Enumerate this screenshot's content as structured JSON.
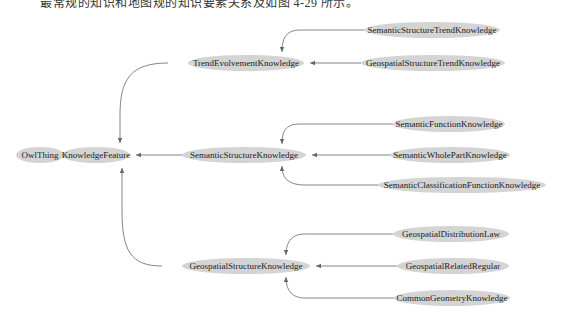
{
  "caption": "最常规的知识和地图规的知识要素关系及如图 4-29 所示。",
  "diagram": {
    "type": "ontology-class-hierarchy",
    "nodes": [
      {
        "id": "owlthing",
        "label": "OwlThing",
        "cx": 40,
        "cy": 155,
        "rx": 24
      },
      {
        "id": "knowledgefeature",
        "label": "KnowledgeFeature",
        "cx": 96,
        "cy": 155,
        "rx": 34
      },
      {
        "id": "trendevolvement",
        "label": "TrendEvolvementKnowledge",
        "cx": 246,
        "cy": 63,
        "rx": 58
      },
      {
        "id": "semanticstructure",
        "label": "SemanticStructureKnowledge",
        "cx": 244,
        "cy": 155,
        "rx": 62
      },
      {
        "id": "geospatialstructure",
        "label": "GeospatialStructureKnowledge",
        "cx": 246,
        "cy": 266,
        "rx": 64
      },
      {
        "id": "semanticstructuretrend",
        "label": "SemanticStructureTrendKnowledge",
        "cx": 432,
        "cy": 30,
        "rx": 68
      },
      {
        "id": "geospatialstructuretrend",
        "label": "GeospatialStructureTrendKnowledge",
        "cx": 433,
        "cy": 63,
        "rx": 72
      },
      {
        "id": "semanticfunction",
        "label": "SemanticFunctionKnowledge",
        "cx": 449,
        "cy": 124,
        "rx": 56
      },
      {
        "id": "semanticwholepart",
        "label": "SemanticWholePartKnowledge",
        "cx": 450,
        "cy": 155,
        "rx": 60
      },
      {
        "id": "semanticclassificationfunction",
        "label": "SemanticClassificationFunctionKnowledge",
        "cx": 462,
        "cy": 185,
        "rx": 84
      },
      {
        "id": "geospatialdistributionlaw",
        "label": "GeospatialDistributionLaw",
        "cx": 451,
        "cy": 234,
        "rx": 58
      },
      {
        "id": "geospatialrelatedregular",
        "label": "GeospatialRelatedRegular",
        "cx": 453,
        "cy": 266,
        "rx": 56
      },
      {
        "id": "commongeometry",
        "label": "CommonGeometryKnowledge",
        "cx": 452,
        "cy": 298,
        "rx": 58
      }
    ],
    "edges": [
      {
        "from": "KnowledgeFeature",
        "to": "OwlThing"
      },
      {
        "from": "TrendEvolvementKnowledge",
        "to": "KnowledgeFeature"
      },
      {
        "from": "SemanticStructureKnowledge",
        "to": "KnowledgeFeature"
      },
      {
        "from": "GeospatialStructureKnowledge",
        "to": "KnowledgeFeature"
      },
      {
        "from": "SemanticStructureTrendKnowledge",
        "to": "TrendEvolvementKnowledge"
      },
      {
        "from": "GeospatialStructureTrendKnowledge",
        "to": "TrendEvolvementKnowledge"
      },
      {
        "from": "SemanticFunctionKnowledge",
        "to": "SemanticStructureKnowledge"
      },
      {
        "from": "SemanticWholePartKnowledge",
        "to": "SemanticStructureKnowledge"
      },
      {
        "from": "SemanticClassificationFunctionKnowledge",
        "to": "SemanticStructureKnowledge"
      },
      {
        "from": "GeospatialDistributionLaw",
        "to": "GeospatialStructureKnowledge"
      },
      {
        "from": "GeospatialRelatedRegular",
        "to": "GeospatialStructureKnowledge"
      },
      {
        "from": "CommonGeometryKnowledge",
        "to": "GeospatialStructureKnowledge"
      }
    ],
    "colors": {
      "node_fill": "#d4d4d4",
      "edge": "#666666",
      "text": "#222222"
    }
  }
}
